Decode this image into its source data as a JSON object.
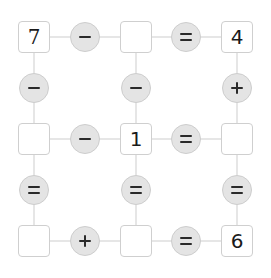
{
  "puzzle": {
    "title": "Arithmetic grid puzzle",
    "grid": [
      [
        "7",
        "-",
        "",
        "=",
        "4"
      ],
      [
        "-",
        null,
        "-",
        null,
        "+"
      ],
      [
        "",
        "-",
        "1",
        "=",
        ""
      ],
      [
        "=",
        null,
        "=",
        null,
        "="
      ],
      [
        "",
        "+",
        "",
        "=",
        "6"
      ]
    ],
    "cells": {
      "r0c0": {
        "value": "7",
        "given": true
      },
      "r0c2": {
        "value": "",
        "given": false
      },
      "r0c4": {
        "value": "4",
        "given": true
      },
      "r2c0": {
        "value": "",
        "given": false
      },
      "r2c2": {
        "value": "1",
        "given": true
      },
      "r2c4": {
        "value": "",
        "given": false
      },
      "r4c0": {
        "value": "",
        "given": false
      },
      "r4c2": {
        "value": "",
        "given": false
      },
      "r4c4": {
        "value": "6",
        "given": true
      }
    },
    "operators": {
      "r0c1": "minus",
      "r0c3": "equals",
      "r1c0": "minus",
      "r1c2": "minus",
      "r1c4": "plus",
      "r2c1": "minus",
      "r2c3": "equals",
      "r3c0": "equals",
      "r3c2": "equals",
      "r3c4": "equals",
      "r4c1": "plus",
      "r4c3": "equals"
    },
    "colors": {
      "cell_border": "#cfcfcf",
      "operator_fill": "#e4e4e4",
      "connector": "#e6e6e6",
      "text": "#1a1a1a"
    }
  }
}
